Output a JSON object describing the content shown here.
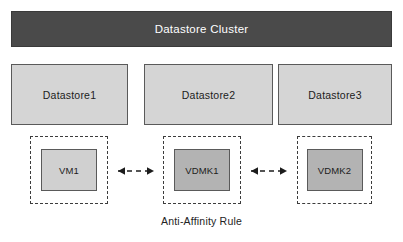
{
  "diagram": {
    "title": "Datastore Cluster",
    "caption": "Anti-Affinity  Rule",
    "colors": {
      "cluster_bar": "#4a4a4a",
      "cluster_text": "#ffffff",
      "datastore_fill": "#d5d5d5",
      "node_fill_light": "#d0d0d0",
      "node_fill_dark": "#b3b3b3",
      "border": "#5a5a5a",
      "dashed_border": "#3c3c3c",
      "background": "#ffffff"
    },
    "cluster": {
      "label": "Datastore Cluster"
    },
    "datastores": [
      {
        "label": "Datastore1"
      },
      {
        "label": "Datastore2"
      },
      {
        "label": "Datastore3"
      }
    ],
    "affinity_groups": [
      {
        "node": {
          "label": "VM1",
          "shade": "light"
        }
      },
      {
        "node": {
          "label": "VDMK1",
          "shade": "dark"
        }
      },
      {
        "node": {
          "label": "VDMK2",
          "shade": "dark"
        }
      }
    ],
    "links": [
      {
        "style": "dashed",
        "heads": "both"
      },
      {
        "style": "dashed",
        "heads": "both"
      }
    ]
  }
}
